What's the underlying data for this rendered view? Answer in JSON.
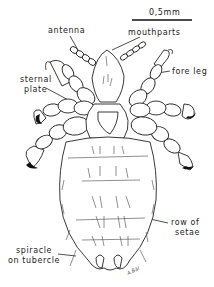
{
  "figure": {
    "scale_bar": {
      "label": "0,5mm"
    },
    "labels": {
      "antenna": "antenna",
      "mouthparts": "mouthparts",
      "fore_leg": "fore leg",
      "sternal_plate_1": "sternal",
      "sternal_plate_2": "plate",
      "row_of_setae_1": "row of",
      "row_of_setae_2": "setae",
      "spiracle_1": "spiracle",
      "spiracle_2": "on tubercle"
    },
    "signature": "A.Bäl"
  }
}
